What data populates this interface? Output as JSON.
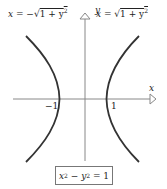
{
  "diagram": {
    "labels": {
      "left_branch": {
        "prefix": "x = −",
        "radical": "√",
        "radicand": "1 + y",
        "exp": "2"
      },
      "right_branch": {
        "prefix": "x = ",
        "radical": "√",
        "radicand": "1 + y",
        "exp": "2"
      },
      "y_axis": "y",
      "x_axis": "x",
      "tick_neg": "−1",
      "tick_pos": "1"
    },
    "equation": {
      "x": "x",
      "x_exp": "2",
      "minus": " − ",
      "y": "y",
      "y_exp": "2",
      "rhs": " = 1"
    },
    "colors": {
      "curve": "#333333",
      "axis": "#888888",
      "text": "#222222",
      "box_border": "#777777"
    }
  }
}
